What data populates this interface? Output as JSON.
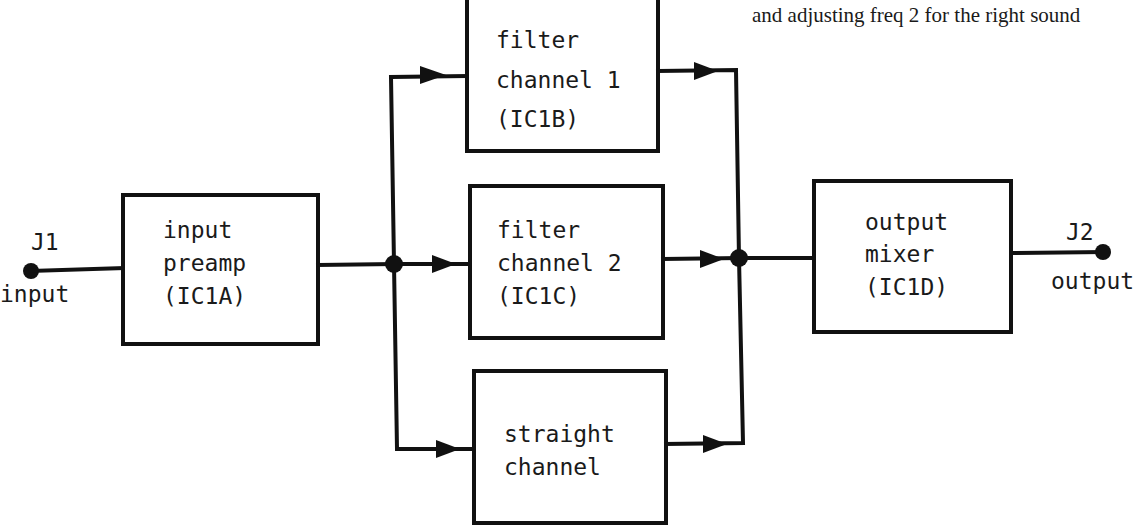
{
  "caption_fragment": "and adjusting freq 2 for the right sound",
  "nodes": {
    "j1": {
      "label": "J1",
      "sublabel": "input"
    },
    "j2": {
      "label": "J2",
      "sublabel": "output"
    },
    "preamp": {
      "lines": [
        "input",
        "preamp",
        "(IC1A)"
      ]
    },
    "filter1": {
      "lines": [
        "filter",
        "channel 1",
        "(IC1B)"
      ]
    },
    "filter2": {
      "lines": [
        "filter",
        "channel 2",
        "(IC1C)"
      ]
    },
    "straight": {
      "lines": [
        "straight",
        "channel"
      ]
    },
    "mixer": {
      "lines": [
        "output",
        "mixer",
        "(IC1D)"
      ]
    }
  },
  "edges": [
    {
      "from": "j1",
      "to": "preamp"
    },
    {
      "from": "preamp",
      "to": "filter1"
    },
    {
      "from": "preamp",
      "to": "filter2"
    },
    {
      "from": "preamp",
      "to": "straight"
    },
    {
      "from": "filter1",
      "to": "mixer"
    },
    {
      "from": "filter2",
      "to": "mixer"
    },
    {
      "from": "straight",
      "to": "mixer"
    },
    {
      "from": "mixer",
      "to": "j2"
    }
  ]
}
